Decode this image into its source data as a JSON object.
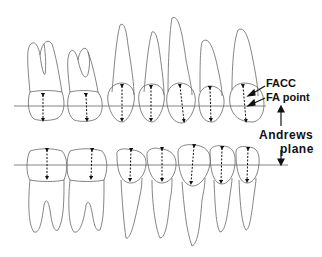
{
  "diagram": {
    "labels": {
      "facc": "FACC",
      "fa_point": "FA point",
      "andrews": "Andrews",
      "plane": "plane"
    },
    "colors": {
      "line": "#555555",
      "arrow": "#111111",
      "background": "#ffffff"
    }
  }
}
